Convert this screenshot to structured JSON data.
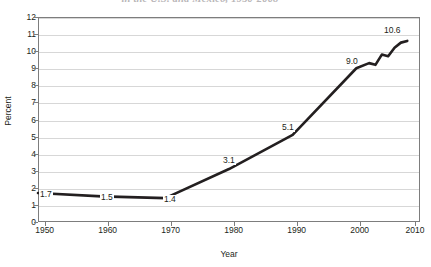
{
  "chart_data": {
    "type": "line",
    "title": "in the U.S. and Mexico, 1950-2008",
    "xlabel": "Year",
    "ylabel": "Percent",
    "xlim": [
      1950,
      2010
    ],
    "ylim": [
      0,
      12
    ],
    "grid": true,
    "legend": "none",
    "x_ticks": [
      "1950",
      "1960",
      "1970",
      "1980",
      "1990",
      "2000",
      "2010"
    ],
    "y_ticks": [
      "0",
      "1",
      "2",
      "3",
      "4",
      "5",
      "6",
      "7",
      "8",
      "9",
      "10",
      "11",
      "12"
    ],
    "x": [
      1950,
      1960,
      1970,
      1980,
      1990,
      2000,
      2002,
      2003,
      2004,
      2005,
      2006,
      2007,
      2008
    ],
    "values": [
      1.7,
      1.5,
      1.4,
      3.1,
      5.1,
      9.0,
      9.3,
      9.2,
      9.8,
      9.7,
      10.2,
      10.5,
      10.6
    ],
    "annotations": [
      {
        "label": "1.7",
        "x": 1950,
        "y": 1.7
      },
      {
        "label": "1.5",
        "x": 1960,
        "y": 1.5
      },
      {
        "label": "1.4",
        "x": 1970,
        "y": 1.4
      },
      {
        "label": "3.1",
        "x": 1980,
        "y": 3.1
      },
      {
        "label": "5.1",
        "x": 1990,
        "y": 5.1
      },
      {
        "label": "9.0",
        "x": 2000,
        "y": 9.0
      },
      {
        "label": "10.6",
        "x": 2008,
        "y": 10.6
      }
    ],
    "series_color": "#231f20",
    "grid_color": "#d7d7d7",
    "axis_color": "#7d7d7d"
  }
}
